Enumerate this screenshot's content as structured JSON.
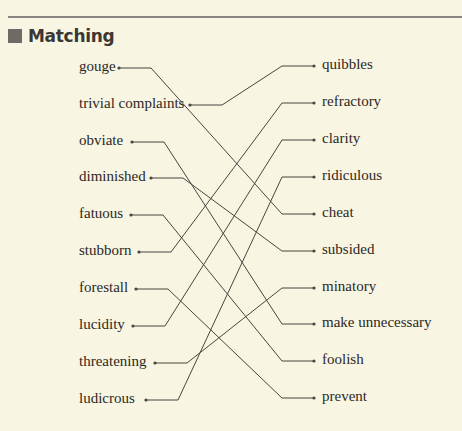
{
  "section": {
    "title": "Matching",
    "icon": "filled-square-bullet"
  },
  "colors": {
    "background": "#f8f5e3",
    "line": "#4a4540",
    "header_square": "#6e6b67"
  },
  "left_items": [
    {
      "label": "gouge",
      "y": 68,
      "dot_x": 119
    },
    {
      "label": "trivial complaints",
      "y": 105,
      "dot_x": 190
    },
    {
      "label": "obviate",
      "y": 142,
      "dot_x": 132
    },
    {
      "label": "diminished",
      "y": 178,
      "dot_x": 151
    },
    {
      "label": "fatuous",
      "y": 215,
      "dot_x": 131
    },
    {
      "label": "stubborn",
      "y": 252,
      "dot_x": 139
    },
    {
      "label": "forestall",
      "y": 289,
      "dot_x": 136
    },
    {
      "label": "lucidity",
      "y": 326,
      "dot_x": 133
    },
    {
      "label": "threatening",
      "y": 363,
      "dot_x": 155
    },
    {
      "label": "ludicrous",
      "y": 400,
      "dot_x": 146
    }
  ],
  "right_items": [
    {
      "label": "quibbles",
      "y": 66
    },
    {
      "label": "refractory",
      "y": 103
    },
    {
      "label": "clarity",
      "y": 140
    },
    {
      "label": "ridiculous",
      "y": 177
    },
    {
      "label": "cheat",
      "y": 214
    },
    {
      "label": "subsided",
      "y": 251
    },
    {
      "label": "minatory",
      "y": 288
    },
    {
      "label": "make unnecessary",
      "y": 324
    },
    {
      "label": "foolish",
      "y": 361
    },
    {
      "label": "prevent",
      "y": 398
    }
  ],
  "matches": [
    {
      "left": "gouge",
      "right": "cheat"
    },
    {
      "left": "trivial complaints",
      "right": "quibbles"
    },
    {
      "left": "obviate",
      "right": "make unnecessary"
    },
    {
      "left": "diminished",
      "right": "subsided"
    },
    {
      "left": "fatuous",
      "right": "foolish"
    },
    {
      "left": "stubborn",
      "right": "refractory"
    },
    {
      "left": "forestall",
      "right": "prevent"
    },
    {
      "left": "lucidity",
      "right": "clarity"
    },
    {
      "left": "threatening",
      "right": "minatory"
    },
    {
      "left": "ludicrous",
      "right": "ridiculous"
    }
  ],
  "layout": {
    "left_text_x": 79,
    "right_dot_x": 314,
    "right_text_x": 322,
    "left_elbow_offset": 22,
    "right_elbow_x": 282
  }
}
